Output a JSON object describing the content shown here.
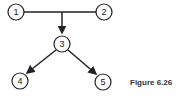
{
  "diagram": {
    "nodes": [
      {
        "id": "1",
        "label": "1",
        "x": 16,
        "y": 12
      },
      {
        "id": "2",
        "label": "2",
        "x": 104,
        "y": 12
      },
      {
        "id": "3",
        "label": "3",
        "x": 62,
        "y": 44
      },
      {
        "id": "4",
        "label": "4",
        "x": 20,
        "y": 81
      },
      {
        "id": "5",
        "label": "5",
        "x": 103,
        "y": 82
      }
    ],
    "edges": [
      {
        "from": "1",
        "to": "2",
        "type": "line"
      },
      {
        "from": "1-2 junction",
        "to": "3",
        "type": "arrow"
      },
      {
        "from": "3",
        "to": "4",
        "type": "arrow"
      },
      {
        "from": "3",
        "to": "5",
        "type": "arrow"
      }
    ]
  },
  "caption": "Figure 6.26"
}
